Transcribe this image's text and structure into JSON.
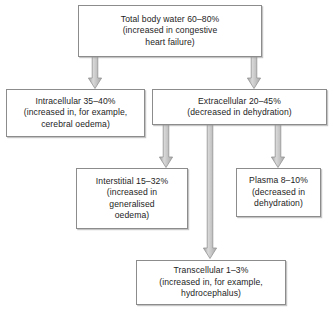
{
  "diagram": {
    "palette": {
      "box_border": "#8c8c8c",
      "box_fill": "#ffffff",
      "text": "#1d1d1d",
      "arrow_fill": "#b0b0b0",
      "arrow_stroke": "#9a9a9a",
      "background": "#ffffff"
    },
    "nodes": [
      {
        "id": "total-body-water",
        "lines": [
          "Total body water 60–80%",
          "(increased in congestive",
          "heart failure)"
        ]
      },
      {
        "id": "intracellular",
        "lines": [
          "Intracellular 35–40%",
          "(increased in, for example,",
          "cerebral oedema)"
        ]
      },
      {
        "id": "extracellular",
        "lines": [
          "Extracellular 20–45%",
          "(decreased in dehydration)"
        ]
      },
      {
        "id": "interstitial",
        "lines": [
          "Interstitial 15–32%",
          "(increased in",
          "generalised",
          "oedema)"
        ]
      },
      {
        "id": "plasma",
        "lines": [
          "Plasma 8–10%",
          "(decreased in",
          "dehydration)"
        ]
      },
      {
        "id": "transcellular",
        "lines": [
          "Transcellular 1–3%",
          "(increased in, for example,",
          "hydrocephalus)"
        ]
      }
    ],
    "edges": [
      {
        "id": "total-to-intracellular",
        "from": "total-body-water",
        "to": "intracellular"
      },
      {
        "id": "total-to-extracellular",
        "from": "total-body-water",
        "to": "extracellular"
      },
      {
        "id": "extracellular-to-interstitial",
        "from": "extracellular",
        "to": "interstitial"
      },
      {
        "id": "extracellular-to-transcellular",
        "from": "extracellular",
        "to": "transcellular"
      },
      {
        "id": "extracellular-to-plasma",
        "from": "extracellular",
        "to": "plasma"
      }
    ]
  }
}
